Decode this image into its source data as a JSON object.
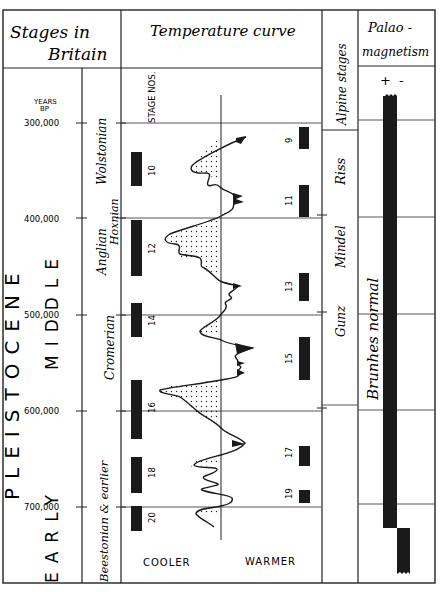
{
  "caption_fragment": "the Cromerian.",
  "headers": {
    "stages_in_britain": "Stages in Britain",
    "stages_line1": "Stages in",
    "stages_line2": "Britain",
    "temperature_curve": "Temperature curve",
    "alpine_stages": "Alpine stages",
    "palaeomagnetism_line1": "Palao -",
    "palaeomagnetism_line2": "magnetism"
  },
  "epoch": {
    "name": "PLEISTOCENE",
    "subdivisions": [
      "MIDDLE",
      "EARLY"
    ]
  },
  "years_axis": {
    "label_line1": "YEARS",
    "label_line2": "BP",
    "ticks": [
      "300,000",
      "400,000",
      "500,000",
      "600,000",
      "700,000"
    ]
  },
  "british_stages": [
    "Wolstonian",
    "Hoxnian",
    "Anglian",
    "Cromerian",
    "Beestonian & earlier"
  ],
  "stage_nos_label": "STAGE NOS.",
  "cold_stage_numbers": [
    "10",
    "12",
    "14",
    "16",
    "18",
    "20"
  ],
  "warm_stage_numbers": [
    "9",
    "11",
    "13",
    "15",
    "17",
    "19"
  ],
  "temperature_axis": {
    "cooler": "COOLER",
    "warmer": "WARMER"
  },
  "alpine": [
    "Riss",
    "Mindel",
    "Gunz"
  ],
  "palaeomagnetism": {
    "plus": "+",
    "minus": "-",
    "chron": "Brunhes normal"
  }
}
